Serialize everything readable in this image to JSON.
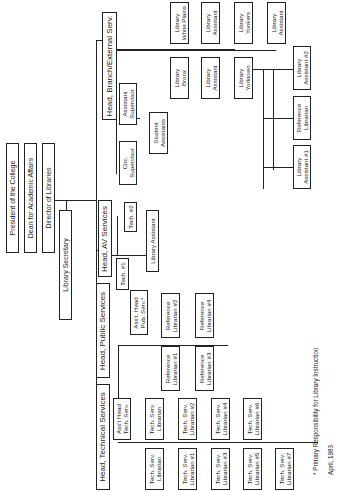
{
  "chart": {
    "top": {
      "president": "President of the College",
      "dean": "Dean for Academic Affairs",
      "director": "Director of Libraries",
      "secretary": "Library Secretary"
    },
    "technical": {
      "head": "Head, Technical Services",
      "asst": [
        "Ass't Head",
        "Tech. Serv."
      ],
      "upper": [
        [
          "Tech. Serv.",
          "Librarian"
        ],
        [
          "Tech. Serv.",
          "Librarian #2"
        ],
        [
          "Tech. Serv.",
          "Librarian #4"
        ],
        [
          "Tech. Serv.",
          "Librarian #6"
        ]
      ],
      "lower": [
        [
          "Tech. Serv.",
          "Librarian"
        ],
        [
          "Tech. Serv.",
          "Librarian #1"
        ],
        [
          "Tech. Serv.",
          "Librarian #3"
        ],
        [
          "Tech. Serv.",
          "Librarian #5"
        ],
        [
          "Tech. Serv.",
          "Librarian #7"
        ]
      ]
    },
    "public": {
      "head": "Head, Public Services",
      "asst": [
        "Ass't. Head",
        "Pub. Serv.*"
      ],
      "upper": [
        [
          "Reference",
          "Librarian #2"
        ],
        [
          "Reference",
          "Librarian #4"
        ]
      ],
      "lower": [
        [
          "Reference",
          "Librarian #1"
        ],
        [
          "Reference",
          "Librarian #3"
        ]
      ]
    },
    "av": {
      "head": "Head, AV Services",
      "tech1": "Tech. #1",
      "tech2": "Tech. #2",
      "assistant": "Library Assistant"
    },
    "branch": {
      "head": "Head, Branch/External Serv.",
      "circ": [
        "Circ.",
        "Supervisor"
      ],
      "asst_sup": [
        "Assistant",
        "Supervisor"
      ],
      "students": [
        "Student",
        "Assistants"
      ],
      "bronx": [
        "Library",
        "Bronx"
      ],
      "white_plains": [
        "Library",
        "White Plains"
      ],
      "la_lower": [
        "Library",
        "Assistant"
      ],
      "la_upper": [
        "Library",
        "Assistant"
      ],
      "yorktown_lower": [
        "Library",
        "Yorktown"
      ],
      "yorktown_upper": [
        "Library",
        "Yonkers"
      ],
      "yonkers_assistant": [
        "Library",
        "Assistant"
      ],
      "yt_la1": [
        "Library",
        "Assistant #1"
      ],
      "yt_ref": [
        "Reference",
        "Librarian"
      ],
      "yt_la2": [
        "Library",
        "Assistant #2"
      ]
    },
    "footnote": "* Primary Responsibility for Library Instruction",
    "date": "April, 1983"
  }
}
